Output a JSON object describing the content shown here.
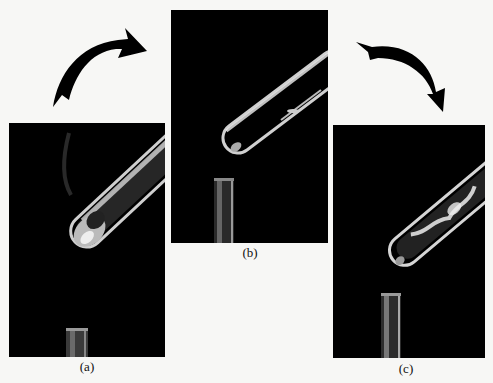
{
  "figure": {
    "panels": [
      {
        "id": "a",
        "caption": "(a)",
        "description": "Test tube with solid contents heated over burner, vapor visible"
      },
      {
        "id": "b",
        "caption": "(b)",
        "description": "Test tube tilted, nearly empty, burner below"
      },
      {
        "id": "c",
        "caption": "(c)",
        "description": "Test tube with condensed residue along walls, burner below"
      }
    ],
    "arrows": [
      {
        "from": "a",
        "to": "b",
        "direction": "curved-right"
      },
      {
        "from": "b",
        "to": "c",
        "direction": "curved-down"
      }
    ],
    "colors": {
      "background": "#f7f7f5",
      "panel": "#000000",
      "arrow": "#000000",
      "glass": "#d9d9d9"
    }
  }
}
